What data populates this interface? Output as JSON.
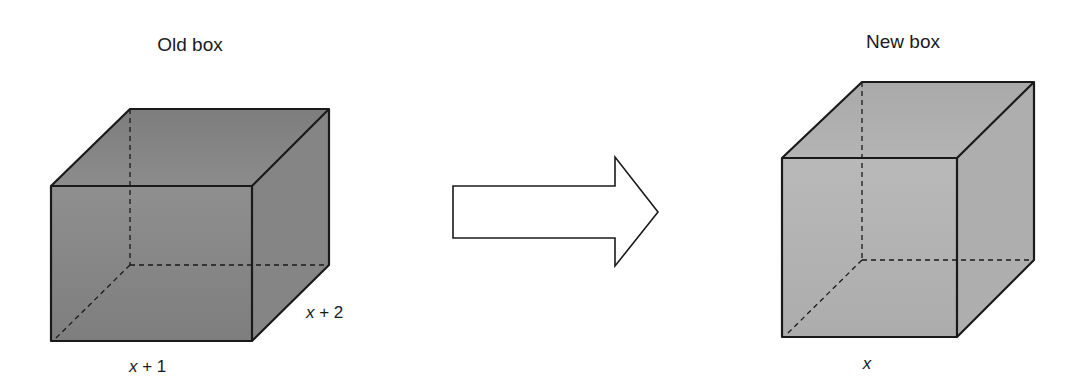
{
  "diagram": {
    "left_box": {
      "title": "Old box",
      "depth_label_var": "x",
      "depth_label_rest": " + 2",
      "width_label_var": "x",
      "width_label_rest": " + 1",
      "fill": "#8a8a8a"
    },
    "arrow": {
      "direction": "right",
      "fill": "#ffffff"
    },
    "right_box": {
      "title": "New box",
      "width_label_var": "x",
      "fill": "#b3b3b3"
    },
    "colors": {
      "stroke": "#1a1a1a",
      "background": "#ffffff"
    }
  }
}
